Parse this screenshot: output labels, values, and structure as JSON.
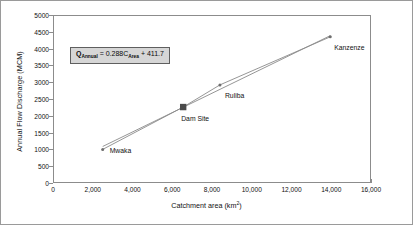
{
  "chart_data": {
    "type": "scatter",
    "title": "",
    "xlabel": "Catchment area (km2)",
    "xlabel_base": "Catchment area (km",
    "xlabel_sup": "2",
    "xlabel_close": ")",
    "ylabel": "Annual Flow Discharge (MCM)",
    "xlim": [
      0,
      16000
    ],
    "ylim": [
      0,
      5000
    ],
    "grid": false,
    "legend": "none",
    "xticks": [
      "0",
      "2,000",
      "4,000",
      "6,000",
      "8,000",
      "10,000",
      "12,000",
      "14,000",
      "16,000"
    ],
    "xtick_values": [
      0,
      2000,
      4000,
      6000,
      8000,
      10000,
      12000,
      14000,
      16000
    ],
    "yticks": [
      "0",
      "500",
      "1000",
      "1500",
      "2000",
      "2500",
      "3000",
      "3500",
      "4000",
      "4500",
      "5000"
    ],
    "ytick_values": [
      0,
      500,
      1000,
      1500,
      2000,
      2500,
      3000,
      3500,
      4000,
      4500,
      5000
    ],
    "points": [
      {
        "name": "Mwaka",
        "x": 2450,
        "y": 1030,
        "marker": "small-circle",
        "label_dx": 7,
        "label_dy": 3
      },
      {
        "name": "Dam Site",
        "x": 6500,
        "y": 2290,
        "marker": "large-square",
        "label_dx": -2,
        "label_dy": 13
      },
      {
        "name": "Ruliba",
        "x": 8350,
        "y": 2950,
        "marker": "small-circle",
        "label_dx": 5,
        "label_dy": 12
      },
      {
        "name": "Kanzenze",
        "x": 13900,
        "y": 4380,
        "marker": "small-circle",
        "label_dx": 4,
        "label_dy": 12
      }
    ],
    "series": [
      {
        "name": "observed",
        "x": [
          2450,
          6500,
          8350,
          13900
        ],
        "values": [
          1030,
          2290,
          2950,
          4380
        ]
      },
      {
        "name": "trendline",
        "x": [
          2450,
          13900
        ],
        "values": [
          1117,
          4415
        ]
      }
    ],
    "equation": {
      "q": "Q",
      "q_sub": "Annual",
      "mid": " = 0.288C",
      "c_sub": "Area",
      "tail": " + 411.7",
      "full": "Q_Annual = 0.288C_Area + 411.7",
      "slope": 0.288,
      "intercept": 411.7,
      "box_fill": "#d6d6d6",
      "box_border": "#5f5f5f"
    },
    "colors": {
      "line": "#8a8a8a",
      "trend": "#8a8a8a",
      "marker": "#6e6e6e",
      "dam_marker": "#4a4a4a",
      "axis": "#8c8c8c",
      "text": "#111111",
      "background": "#ffffff"
    }
  }
}
